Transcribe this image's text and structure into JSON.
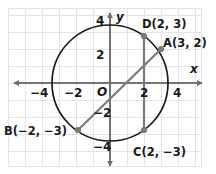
{
  "figure": {
    "type": "coordinate-plane-circle",
    "background_color": "#ffffff",
    "grid_color": "#e2e4ea",
    "axis_color": "#6e6e6e",
    "curve_color": "#1a1a1a",
    "segment_color": "#7a7a7a",
    "point_color": "#7a7a7a",
    "label_color": "#1a1a1a"
  },
  "axes": {
    "x_axis_name": "x",
    "y_axis_name": "y",
    "origin_label": "O",
    "x_ticks": [
      "-4",
      "-2",
      "2",
      "4"
    ],
    "y_ticks": [
      "4",
      "2",
      "-2",
      "-4"
    ],
    "x_tick_values": [
      -4,
      -2,
      2,
      4
    ],
    "y_tick_values": [
      4,
      2,
      -2,
      -4
    ],
    "x_range": [
      -5.6,
      6.2
    ],
    "y_range": [
      -4.9,
      4.4
    ],
    "units_per_tick": 2,
    "pixels_per_unit": 17
  },
  "circle": {
    "center": [
      0,
      0
    ],
    "radius_units": 3.4,
    "center_px": [
      110,
      83
    ],
    "radius_px": 58
  },
  "points": [
    {
      "id": "D",
      "label": "D(2, 3)",
      "name": "D",
      "x": 2,
      "y": 3,
      "px": [
        144,
        36
      ],
      "label_px": [
        147,
        22
      ]
    },
    {
      "id": "A",
      "label": "A(3, 2)",
      "name": "A",
      "x": 3,
      "y": 2,
      "px": [
        161,
        49
      ],
      "label_px": [
        165,
        36
      ]
    },
    {
      "id": "B",
      "label": "B(-2, -3)",
      "name": "B",
      "x": -2,
      "y": -3,
      "px": [
        78,
        130
      ],
      "label_px": [
        6,
        124
      ]
    },
    {
      "id": "C",
      "label": "C(2, -3)",
      "name": "C",
      "x": 2,
      "y": -3,
      "px": [
        144,
        130
      ],
      "label_px": [
        136,
        146
      ]
    }
  ],
  "segments": [
    {
      "id": "BA",
      "name": "diameter-b-to-a",
      "from": "B",
      "to": "A",
      "from_px": [
        78,
        130
      ],
      "to_px": [
        161,
        49
      ]
    },
    {
      "id": "DC",
      "name": "chord-d-to-c",
      "from": "D",
      "to": "C",
      "from_px": [
        144,
        36
      ],
      "to_px": [
        144,
        130
      ]
    }
  ]
}
